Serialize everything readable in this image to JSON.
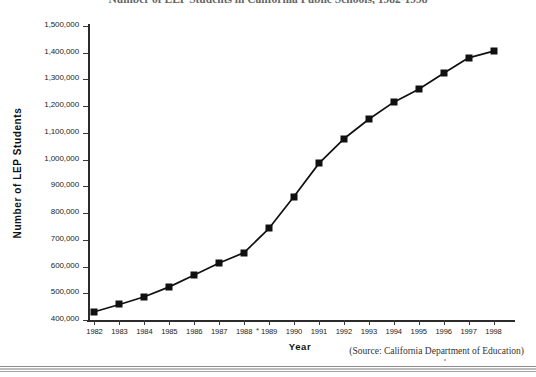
{
  "chart_data": {
    "type": "line",
    "title": "Number of LEP Students in California Public Schools, 1982-1998",
    "xlabel": "Year",
    "ylabel": "Number of LEP Students",
    "categories": [
      "1982",
      "1983",
      "1984",
      "1985",
      "1986",
      "1987",
      "1988",
      "1989",
      "1990",
      "1991",
      "1992",
      "1993",
      "1994",
      "1995",
      "1996",
      "1997",
      "1998"
    ],
    "values": [
      431000,
      458000,
      487000,
      524000,
      568000,
      613000,
      652000,
      743000,
      862000,
      986000,
      1078000,
      1151000,
      1215000,
      1263000,
      1323000,
      1381000,
      1406000
    ],
    "ylim": [
      400000,
      1500000
    ],
    "ytick_labels": [
      "1,500,000",
      "1,400,000",
      "1,300,000",
      "1,200,000",
      "1,100,000",
      "1,000,000",
      "900,000",
      "800,000",
      "700,000",
      "600,000",
      "500,000",
      "400,000"
    ],
    "ytick_values": [
      1500000,
      1400000,
      1300000,
      1200000,
      1100000,
      1000000,
      900000,
      800000,
      700000,
      600000,
      500000,
      400000
    ],
    "grid": false,
    "legend": null,
    "marker": "square",
    "series_color": "#101010"
  },
  "source_note": "(Source: California Department of Education)",
  "stray_mark": "*"
}
